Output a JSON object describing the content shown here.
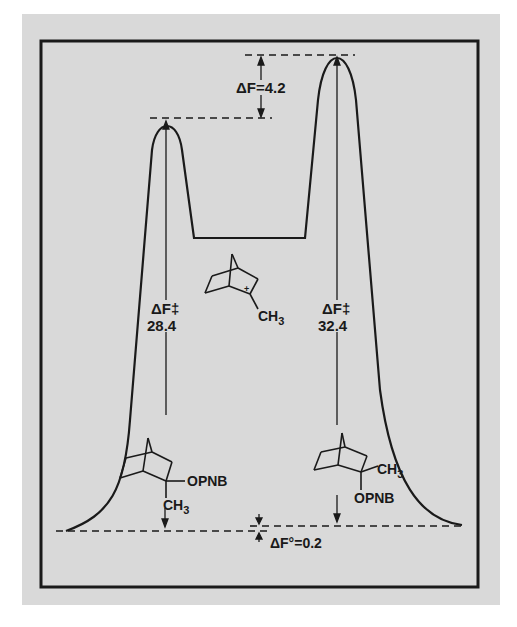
{
  "figure": {
    "type": "free-energy reaction coordinate diagram",
    "background_color": "#d9d9d9",
    "line_color": "#1a1a1a"
  },
  "labels": {
    "delta_f_barrier_diff": "ΔF=4.2",
    "left_barrier_symbol": "ΔF‡",
    "left_barrier_value": "28.4",
    "right_barrier_symbol": "ΔF‡",
    "right_barrier_value": "32.4",
    "ground_state_diff": "ΔF°=0.2"
  },
  "molecules": {
    "intermediate": {
      "name": "2-methyl-2-norbornyl cation",
      "charge": "+",
      "substituent": "CH3"
    },
    "left_reactant": {
      "name": "exo-2-methyl-2-norbornyl p-nitrobenzoate",
      "substituent_top": "OPNB",
      "substituent_bottom": "CH3"
    },
    "right_reactant": {
      "name": "endo-2-methyl-2-norbornyl p-nitrobenzoate",
      "substituent_top": "CH3",
      "substituent_bottom": "OPNB"
    }
  },
  "text": {
    "ch3": "CH",
    "sub3": "3",
    "opnb": "OPNB",
    "plus": "+"
  },
  "energies": {
    "left_barrier": 28.4,
    "right_barrier": 32.4,
    "transition_state_difference": 4.2,
    "ground_state_difference": 0.2
  }
}
